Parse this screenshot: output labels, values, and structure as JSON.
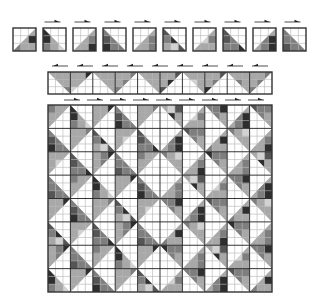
{
  "colors": {
    "background": "#ffffff",
    "cell_line": "#b4b4b4",
    "block_line": "#1e1e1e",
    "border": "#333333",
    "arrow": "#222222",
    "shades": [
      "#ffffff",
      "#d2d2d2",
      "#a8a8a8",
      "#7e7e7e",
      "#555555",
      "#2e2e2e"
    ]
  },
  "tile_row": {
    "x": [
      13,
      43,
      73,
      103,
      133,
      163,
      193,
      223,
      253,
      283
    ],
    "y": 28,
    "size": 23,
    "arrows_y": 22,
    "arrow_direction": "right",
    "arrow_on_tiles": [
      1,
      2,
      3,
      4,
      5,
      6,
      7,
      8,
      9
    ],
    "tiles": [
      {
        "diag": "/",
        "cells": [
          0,
          0,
          0,
          0,
          0,
          5,
          3,
          2,
          2
        ]
      },
      {
        "diag": "\\",
        "cells": [
          5,
          0,
          0,
          5,
          2,
          0,
          3,
          2,
          1
        ]
      },
      {
        "diag": "/",
        "cells": [
          0,
          0,
          0,
          0,
          2,
          3,
          2,
          2,
          5
        ]
      },
      {
        "diag": "\\",
        "cells": [
          3,
          0,
          0,
          4,
          3,
          0,
          5,
          3,
          3
        ]
      },
      {
        "diag": "/",
        "cells": [
          0,
          0,
          0,
          0,
          2,
          3,
          2,
          2,
          3
        ]
      },
      {
        "diag": "\\",
        "cells": [
          4,
          0,
          0,
          3,
          5,
          0,
          2,
          1,
          4
        ]
      },
      {
        "diag": "/",
        "cells": [
          0,
          0,
          0,
          0,
          1,
          3,
          2,
          2,
          2
        ]
      },
      {
        "diag": "\\",
        "cells": [
          4,
          0,
          0,
          4,
          3,
          0,
          3,
          3,
          5
        ]
      },
      {
        "diag": "/",
        "cells": [
          0,
          0,
          0,
          0,
          3,
          5,
          2,
          3,
          5
        ]
      },
      {
        "diag": "\\",
        "cells": [
          3,
          0,
          0,
          3,
          3,
          0,
          4,
          3,
          3
        ]
      }
    ]
  },
  "strip": {
    "x": 48,
    "y": 72,
    "width": 224,
    "height": 22,
    "cols": 30,
    "rows": 3,
    "arrows_y": 66,
    "arrow_direction": "left",
    "arrow_count": 9,
    "pattern": "inverted-triangles"
  },
  "quilt": {
    "x": 48,
    "y": 105,
    "width": 224,
    "height": 187,
    "blocks_x": 10,
    "blocks_y": 8,
    "arrows_y": 100,
    "arrow_direction": "right",
    "arrow_count": 9,
    "pattern": "concentric-diamonds"
  }
}
